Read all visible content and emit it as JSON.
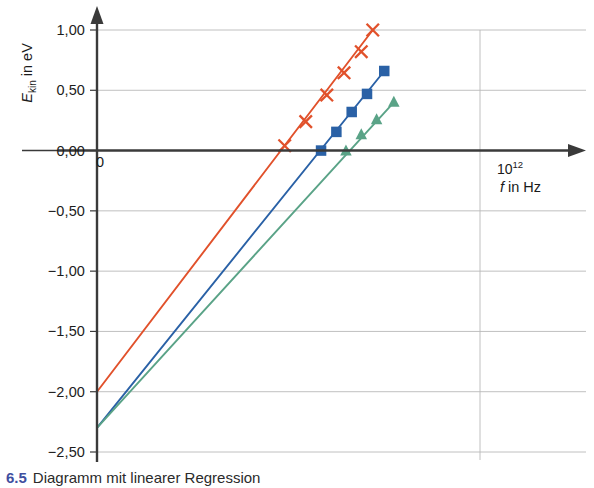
{
  "figure": {
    "caption_number": "6.5",
    "caption_text": "Diagramm mit linearer Regression"
  },
  "axes": {
    "y_title": "E",
    "y_title_sub": "kin",
    "y_title_unit": " in eV",
    "x_title": "f",
    "x_title_unit": " in Hz",
    "x_tick_mantissa": "10",
    "x_tick_exponent": "12",
    "origin_label": "0"
  },
  "chart_data": {
    "type": "scatter",
    "title": "",
    "xlabel": "f in Hz",
    "ylabel": "E_kin in eV",
    "xlim": [
      0,
      1.24
    ],
    "ylim": [
      -2.5,
      1.15
    ],
    "x_unit": "1e12 Hz",
    "y_unit": "eV",
    "grid": "horizontal gridlines every 0.5 eV; one vertical gridline at x = 1e12",
    "legend": "none",
    "y_ticks": [
      1.0,
      0.5,
      0.0,
      -0.5,
      -1.0,
      -1.5,
      -2.0,
      -2.5
    ],
    "y_tick_labels": [
      "1,00",
      "0,50",
      "0,00",
      "−0,50",
      "−1,00",
      "−1,50",
      "−2,00",
      "−2,50"
    ],
    "x_ticks": [
      1.0
    ],
    "x_tick_labels": [
      "10¹²"
    ],
    "series": [
      {
        "name": "series-orange",
        "color": "#E1512B",
        "marker": "cross",
        "intercept": -2.0,
        "slope": 4.15,
        "line_x": [
          0.0,
          0.72
        ],
        "line_y": [
          -2.0,
          1.0
        ],
        "x": [
          0.49,
          0.545,
          0.6,
          0.645,
          0.69,
          0.72
        ],
        "y": [
          0.04,
          0.24,
          0.46,
          0.645,
          0.82,
          1.0
        ]
      },
      {
        "name": "series-blue",
        "color": "#2A61A6",
        "marker": "square",
        "intercept": -2.3,
        "slope": 3.95,
        "line_x": [
          0.0,
          0.75
        ],
        "line_y": [
          -2.3,
          0.66
        ],
        "x": [
          0.585,
          0.625,
          0.665,
          0.705,
          0.75
        ],
        "y": [
          0.0,
          0.155,
          0.32,
          0.47,
          0.66
        ]
      },
      {
        "name": "series-green",
        "color": "#5AA387",
        "marker": "triangle",
        "intercept": -2.3,
        "slope": 3.55,
        "line_x": [
          0.0,
          0.775
        ],
        "line_y": [
          -2.3,
          0.4
        ],
        "x": [
          0.65,
          0.69,
          0.73,
          0.775
        ],
        "y": [
          -0.005,
          0.13,
          0.255,
          0.4
        ]
      }
    ]
  }
}
